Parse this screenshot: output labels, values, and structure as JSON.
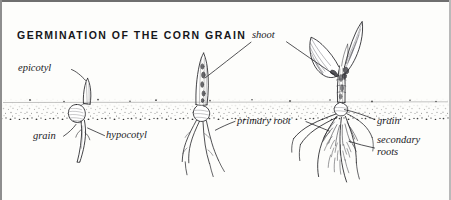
{
  "figure": {
    "title": "GERMINATION OF THE CORN GRAIN",
    "background_color": "#fdfdfb",
    "ink_color": "#1b1b1f",
    "soil_color": "#3a3a3a"
  },
  "labels": {
    "epicotyl": "epicotyl",
    "grain_left": "grain",
    "hypocotyl": "hypocotyl",
    "shoot": "shoot",
    "primary_root": "primary root",
    "grain_right": "grain",
    "secondary_roots_line1": "secondary",
    "secondary_roots_line2": "roots"
  },
  "stages": [
    {
      "name": "stage-1-sprouting-grain",
      "description": "grain at soil level with emerging epicotyl above and hypocotyl below",
      "parts": [
        "epicotyl",
        "grain",
        "hypocotyl"
      ]
    },
    {
      "name": "stage-2-young-seedling",
      "description": "pointed shoot spike above soil with primary roots below",
      "parts": [
        "shoot",
        "primary root"
      ]
    },
    {
      "name": "stage-3-leafed-seedling",
      "description": "seedling with broad corn leaves and fibrous root system",
      "parts": [
        "shoot",
        "grain",
        "secondary roots"
      ]
    }
  ],
  "soil_line": {
    "label": "soil surface",
    "y": 104
  }
}
